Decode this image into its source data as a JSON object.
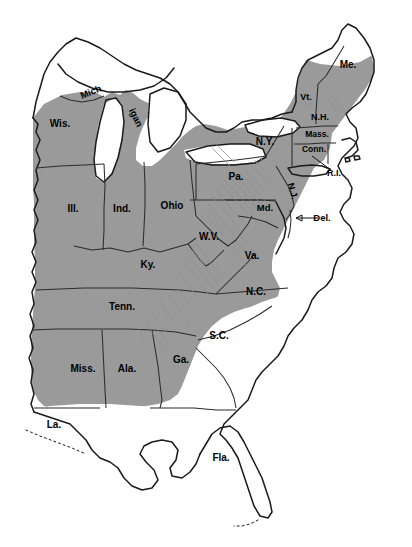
{
  "map": {
    "title": "Eastern United States",
    "background_color": "#ffffff",
    "shaded_region_color": "#9a9a9a",
    "unshaded_region_color": "#ffffff",
    "outline_color": "#1a1a1a",
    "border_color": "#2b2b2b",
    "ridge_color": "#8f8f8f",
    "label_color": "#000000",
    "legend_note": "Shaded area indicates the mapped range; unshaded coastal plain and Florida fall outside it.",
    "labels": [
      {
        "id": "wisconsin",
        "text": "Wis.",
        "x": 60,
        "y": 127,
        "size": 10,
        "rotate": 0,
        "shaded": true
      },
      {
        "id": "michigan-up",
        "text": "Mich",
        "x": 92,
        "y": 95,
        "size": 9.5,
        "rotate": -22,
        "shaded": true
      },
      {
        "id": "michigan-lp",
        "text": "igan",
        "x": 133,
        "y": 119,
        "size": 9.5,
        "rotate": 64,
        "shaded": true
      },
      {
        "id": "illinois",
        "text": "Ill.",
        "x": 73,
        "y": 212,
        "size": 10,
        "rotate": 0,
        "shaded": true
      },
      {
        "id": "indiana",
        "text": "Ind.",
        "x": 122,
        "y": 212,
        "size": 10,
        "rotate": 0,
        "shaded": true
      },
      {
        "id": "ohio",
        "text": "Ohio",
        "x": 172,
        "y": 209,
        "size": 10,
        "rotate": 0,
        "shaded": true
      },
      {
        "id": "kentucky",
        "text": "Ky.",
        "x": 148,
        "y": 268,
        "size": 10,
        "rotate": 0,
        "shaded": true
      },
      {
        "id": "tennessee",
        "text": "Tenn.",
        "x": 122,
        "y": 310,
        "size": 10,
        "rotate": 0,
        "shaded": true
      },
      {
        "id": "mississippi",
        "text": "Miss.",
        "x": 83,
        "y": 372,
        "size": 10,
        "rotate": 0,
        "shaded": true
      },
      {
        "id": "alabama",
        "text": "Ala.",
        "x": 127,
        "y": 372,
        "size": 10,
        "rotate": 0,
        "shaded": true
      },
      {
        "id": "louisiana",
        "text": "La.",
        "x": 54,
        "y": 428,
        "size": 10,
        "rotate": 0,
        "shaded": false
      },
      {
        "id": "georgia",
        "text": "Ga.",
        "x": 181,
        "y": 363,
        "size": 10,
        "rotate": 0,
        "shaded": false
      },
      {
        "id": "florida",
        "text": "Fla.",
        "x": 221,
        "y": 461,
        "size": 10,
        "rotate": 0,
        "shaded": false
      },
      {
        "id": "south-carolina",
        "text": "S.C.",
        "x": 219,
        "y": 339,
        "size": 10,
        "rotate": 0,
        "shaded": false
      },
      {
        "id": "north-carolina",
        "text": "N.C.",
        "x": 256,
        "y": 295,
        "size": 10,
        "rotate": 0,
        "shaded": true
      },
      {
        "id": "virginia",
        "text": "Va.",
        "x": 252,
        "y": 259,
        "size": 10,
        "rotate": 0,
        "shaded": true
      },
      {
        "id": "west-virginia",
        "text": "W.V.",
        "x": 209,
        "y": 240,
        "size": 10,
        "rotate": 0,
        "shaded": true
      },
      {
        "id": "maryland",
        "text": "Md.",
        "x": 265,
        "y": 211,
        "size": 9.5,
        "rotate": 0,
        "shaded": true
      },
      {
        "id": "delaware",
        "text": "Del.",
        "x": 322,
        "y": 221,
        "size": 9.5,
        "rotate": 0,
        "shaded": false
      },
      {
        "id": "pennsylvania",
        "text": "Pa.",
        "x": 236,
        "y": 180,
        "size": 10,
        "rotate": 0,
        "shaded": true
      },
      {
        "id": "new-jersey",
        "text": "N.J.",
        "x": 290,
        "y": 192,
        "size": 9,
        "rotate": 74,
        "shaded": true
      },
      {
        "id": "new-york",
        "text": "N.Y.",
        "x": 265,
        "y": 145,
        "size": 10,
        "rotate": 0,
        "shaded": true
      },
      {
        "id": "connecticut",
        "text": "Conn.",
        "x": 314,
        "y": 152,
        "size": 8.5,
        "rotate": 0,
        "shaded": true
      },
      {
        "id": "rhode-island",
        "text": "R.I.",
        "x": 334,
        "y": 176,
        "size": 9,
        "rotate": 0,
        "shaded": false
      },
      {
        "id": "massachusetts",
        "text": "Mass.",
        "x": 317,
        "y": 137,
        "size": 8.5,
        "rotate": 0,
        "shaded": true
      },
      {
        "id": "vermont",
        "text": "Vt.",
        "x": 306,
        "y": 100,
        "size": 9,
        "rotate": 0,
        "shaded": true
      },
      {
        "id": "new-hampshire",
        "text": "N.H.",
        "x": 320,
        "y": 120,
        "size": 9,
        "rotate": 0,
        "shaded": true
      },
      {
        "id": "maine",
        "text": "Me.",
        "x": 348,
        "y": 68,
        "size": 10,
        "rotate": 0,
        "shaded": true
      }
    ],
    "leaders": [
      {
        "id": "leader-rhode-island",
        "from_x": 331,
        "from_y": 170,
        "to_x": 312,
        "to_y": 156,
        "arrow": false
      },
      {
        "id": "leader-delaware",
        "from_x": 318,
        "from_y": 218,
        "to_x": 296,
        "to_y": 218,
        "arrow": true
      }
    ]
  }
}
